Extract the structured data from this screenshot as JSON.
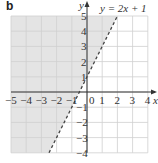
{
  "part_label": "b",
  "equation_label": "y = 2x + 1",
  "axis_labels": {
    "x": "x",
    "y": "y"
  },
  "colors": {
    "shade": "#e4e4e4",
    "grid": "#cfcfcf",
    "axis": "#333333",
    "line": "#444444"
  },
  "chart_data": {
    "type": "line",
    "title": "",
    "xlabel": "x",
    "ylabel": "y",
    "xlim": [
      -5,
      4
    ],
    "ylim": [
      -4,
      5
    ],
    "grid": true,
    "x_ticks": [
      -5,
      -4,
      -3,
      -2,
      -1,
      0,
      1,
      2,
      3,
      4
    ],
    "y_ticks": [
      -4,
      -3,
      -2,
      -1,
      1,
      2,
      3,
      4,
      5
    ],
    "series": [
      {
        "name": "y = 2x + 1",
        "style": "dashed",
        "slope": 2,
        "intercept": 1,
        "x": [
          -2.5,
          2
        ],
        "y": [
          -4,
          5
        ]
      }
    ],
    "shaded_region": {
      "inequality": "y > 2x + 1",
      "side": "left/above line",
      "boundary": "dashed (strict)"
    },
    "annotations": [
      "b",
      "y = 2x + 1"
    ]
  }
}
